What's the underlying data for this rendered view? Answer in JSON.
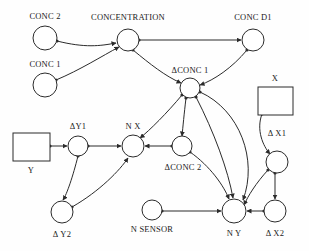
{
  "diagram": {
    "background_color": "#fefefe",
    "stroke_color": "#2b2b2b",
    "node_fill": "#ffffff",
    "nodes": [
      {
        "id": "conc2",
        "label": "CONC 2",
        "shape": "circle",
        "cx": 45,
        "cy": 38,
        "r": 12,
        "label_x": 45,
        "label_y": 16
      },
      {
        "id": "conc1",
        "label": "CONC 1",
        "shape": "circle",
        "cx": 45,
        "cy": 85,
        "r": 12,
        "label_x": 45,
        "label_y": 64
      },
      {
        "id": "concentration",
        "label": "CONCENTRATION",
        "shape": "circle",
        "cx": 128,
        "cy": 40,
        "r": 11,
        "label_x": 128,
        "label_y": 17
      },
      {
        "id": "concd1",
        "label": "CONC D1",
        "shape": "circle",
        "cx": 253,
        "cy": 40,
        "r": 11,
        "label_x": 253,
        "label_y": 17
      },
      {
        "id": "dconc1",
        "label": "ΔCONC 1",
        "shape": "circle",
        "cx": 190,
        "cy": 88,
        "r": 10,
        "label_x": 190,
        "label_y": 70
      },
      {
        "id": "x",
        "label": "X",
        "shape": "rect",
        "x": 258,
        "y": 87,
        "w": 35,
        "h": 28,
        "label_x": 275,
        "label_y": 78
      },
      {
        "id": "y",
        "label": "Y",
        "shape": "rect",
        "x": 13,
        "y": 133,
        "w": 37,
        "h": 28,
        "label_x": 31,
        "label_y": 170
      },
      {
        "id": "dy1",
        "label": "ΔY1",
        "shape": "circle",
        "cx": 78,
        "cy": 146,
        "r": 10,
        "label_x": 78,
        "label_y": 126
      },
      {
        "id": "nx",
        "label": "N X",
        "shape": "circle",
        "cx": 133,
        "cy": 146,
        "r": 11,
        "label_x": 133,
        "label_y": 126
      },
      {
        "id": "dconc2",
        "label": "ΔCONC 2",
        "shape": "circle",
        "cx": 182,
        "cy": 146,
        "r": 10,
        "label_x": 183,
        "label_y": 167
      },
      {
        "id": "dx1",
        "label": "Δ X1",
        "shape": "circle",
        "cx": 277,
        "cy": 162,
        "r": 11,
        "label_x": 277,
        "label_y": 133
      },
      {
        "id": "dy2",
        "label": "Δ Y2",
        "shape": "circle",
        "cx": 62,
        "cy": 212,
        "r": 11,
        "label_x": 62,
        "label_y": 234
      },
      {
        "id": "nsensor",
        "label": "N SENSOR",
        "shape": "circle",
        "cx": 152,
        "cy": 210,
        "r": 10,
        "label_x": 152,
        "label_y": 229
      },
      {
        "id": "ny",
        "label": "N Y",
        "shape": "circle",
        "cx": 234,
        "cy": 211,
        "r": 12,
        "label_x": 234,
        "label_y": 233
      },
      {
        "id": "dx2",
        "label": "Δ X2",
        "shape": "circle",
        "cx": 275,
        "cy": 211,
        "r": 11,
        "label_x": 275,
        "label_y": 233
      }
    ],
    "edges": [
      {
        "from": "conc2",
        "to": "concentration",
        "path": "M 57,41 C 85,48 100,46 116,43"
      },
      {
        "from": "conc1",
        "to": "concentration",
        "path": "M 56,80 C 80,70 102,56 119,47"
      },
      {
        "from": "concentration",
        "to": "concd1",
        "path": "M 139,40 L 241,40"
      },
      {
        "from": "concentration",
        "to": "dconc1",
        "path": "M 133,50 C 150,64 165,76 181,83"
      },
      {
        "from": "concd1",
        "to": "dconc1",
        "path": "M 247,50 C 232,68 214,80 200,85"
      },
      {
        "from": "dconc1",
        "to": "nx",
        "path": "M 182,95 C 167,113 150,130 140,138"
      },
      {
        "from": "dconc1",
        "to": "dconc2",
        "path": "M 186,98 C 184,115 183,126 182,136"
      },
      {
        "from": "dconc1",
        "to": "ny",
        "path": "M 196,97 C 214,132 228,170 233,198"
      },
      {
        "from": "dconc1",
        "to": "ny2",
        "path": "M 200,92 C 240,110 258,160 243,200"
      },
      {
        "from": "dconc2",
        "to": "nx",
        "path": "M 172,146 L 145,146"
      },
      {
        "from": "dconc2",
        "to": "ny",
        "path": "M 190,152 C 210,166 224,186 229,199"
      },
      {
        "from": "x",
        "to": "dx1",
        "path": "M 262,114 C 256,130 263,146 270,154"
      },
      {
        "from": "dx1",
        "to": "dx2",
        "path": "M 275,173 L 275,199"
      },
      {
        "from": "dx1",
        "to": "ny",
        "path": "M 268,170 C 256,183 248,196 244,205"
      },
      {
        "from": "y",
        "to": "dy1",
        "path": "M 50,146 L 67,146"
      },
      {
        "from": "dy1",
        "to": "nx",
        "path": "M 88,146 L 121,146"
      },
      {
        "from": "dy1",
        "to": "dy2",
        "path": "M 78,156 C 73,176 67,194 63,200"
      },
      {
        "from": "dy2",
        "to": "nx",
        "path": "M 72,207 C 100,191 120,170 128,158"
      },
      {
        "from": "nsensor",
        "to": "ny",
        "path": "M 162,211 L 221,211"
      },
      {
        "from": "dx2",
        "to": "ny",
        "path": "M 264,211 L 247,211"
      }
    ]
  }
}
